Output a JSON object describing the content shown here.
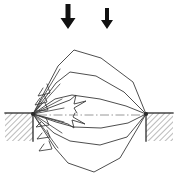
{
  "figure": {
    "title": "Crack opening displacement diagram",
    "kind": "technical-line-diagram",
    "canvas": {
      "width": 177,
      "height": 183,
      "background": "#ffffff"
    },
    "ink_color": "#3a3a3a",
    "dark_ink_color": "#111111",
    "centerline_color": "#8d8d8d",
    "hatch_color": "#4a4a4a"
  },
  "load_arrows": [
    {
      "name": "left-load-arrow",
      "x": 68,
      "y_top": 4,
      "y_tip": 29,
      "shaft_width": 5.0,
      "head_width": 15,
      "head_height": 11
    },
    {
      "name": "right-load-arrow",
      "x": 107,
      "y_top": 8,
      "y_tip": 29,
      "shaft_width": 4.0,
      "head_width": 12,
      "head_height": 9
    }
  ],
  "supports": [
    {
      "name": "left-support",
      "x": 5,
      "y": 113,
      "width": 28,
      "height": 28,
      "hatch_angle_deg": 45,
      "edge_x": 33
    },
    {
      "name": "right-support",
      "x": 146,
      "y": 113,
      "width": 27,
      "height": 28,
      "hatch_angle_deg": 45,
      "edge_x": 146
    }
  ],
  "hinges": [
    {
      "name": "left-hinge",
      "x": 33,
      "y": 114
    },
    {
      "name": "right-hinge",
      "x": 146,
      "y": 114
    }
  ],
  "centerline": {
    "name": "axis-centerline",
    "x1": 38,
    "y1": 115,
    "x2": 144,
    "y2": 115
  },
  "lens_outlines": [
    {
      "name": "lens-outline-1",
      "points": "33,114 58,66 74,50 101,58 133,82 146,114"
    },
    {
      "name": "lens-outline-2",
      "points": "33,114 56,83 70,72 96,76 124,92 146,114"
    },
    {
      "name": "lens-outline-3",
      "points": "33,114 55,99 72,95 100,99 126,106 146,114"
    },
    {
      "name": "lens-outline-4",
      "points": "33,114 56,122 74,127 101,128 128,123 146,114"
    },
    {
      "name": "lens-outline-5",
      "points": "33,114 54,133 70,141 100,145 127,137 146,114"
    },
    {
      "name": "lens-outline-6",
      "points": "33,114 55,148 68,163 94,172 120,158 146,114"
    }
  ],
  "rays": [
    {
      "name": "ray-1",
      "x1": 33,
      "y1": 114,
      "x2": 60,
      "y2": 69
    },
    {
      "name": "ray-2",
      "x1": 33,
      "y1": 114,
      "x2": 60,
      "y2": 84
    },
    {
      "name": "ray-3",
      "x1": 33,
      "y1": 114,
      "x2": 62,
      "y2": 99
    },
    {
      "name": "ray-4",
      "x1": 33,
      "y1": 114,
      "x2": 64,
      "y2": 108
    },
    {
      "name": "ray-5",
      "x1": 33,
      "y1": 114,
      "x2": 64,
      "y2": 122
    },
    {
      "name": "ray-6",
      "x1": 33,
      "y1": 114,
      "x2": 62,
      "y2": 133
    },
    {
      "name": "ray-7",
      "x1": 33,
      "y1": 114,
      "x2": 58,
      "y2": 148
    }
  ],
  "radiating_arrowheads": [
    {
      "name": "arrowhead-1",
      "points": "43,88 38,96 50,93 47,84"
    },
    {
      "name": "arrowhead-2",
      "points": "40,98 35,105 47,102 44,94"
    },
    {
      "name": "arrowhead-3",
      "points": "40,106 35,111 48,110 45,103"
    },
    {
      "name": "arrowhead-4",
      "points": "41,122 36,127 49,125 46,118"
    },
    {
      "name": "arrowhead-5",
      "points": "42,133 37,139 50,137 47,130"
    },
    {
      "name": "arrowhead-6",
      "points": "44,144 39,151 52,149 49,141"
    }
  ],
  "inner_arrow_shapes": [
    {
      "name": "inner-arrow-upper",
      "points": "33,114 70,100 76,95 74,104 84,101 74,108 76,113"
    },
    {
      "name": "inner-arrow-lower",
      "points": "33,114 68,124 74,128 72,120 84,124 73,117 74,113"
    }
  ]
}
